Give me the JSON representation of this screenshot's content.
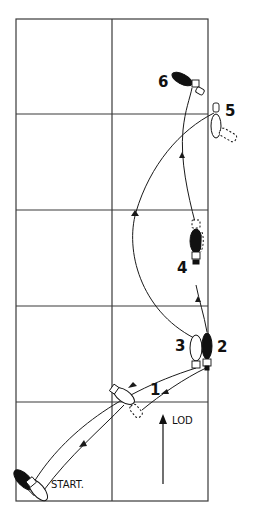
{
  "diagram": {
    "type": "dance-step-floor-pattern",
    "colors": {
      "line": "#1a1a1a",
      "grid": "#3a3a3a",
      "background": "#ffffff",
      "leader_foot": "#111111"
    },
    "grid": {
      "columns": 2,
      "rows": 5,
      "x": [
        16,
        112,
        208
      ],
      "y": [
        19,
        114,
        210,
        306,
        402,
        501
      ]
    },
    "labels": {
      "start": "START.",
      "lod": "LOD",
      "step_1": "1",
      "step_2": "2",
      "step_3": "3",
      "step_4": "4",
      "step_5": "5",
      "step_6": "6"
    },
    "heel_letters": {
      "left": "L",
      "right": "R"
    },
    "legend": {
      "black_foot": "leader foot (filled)",
      "white_foot": "foot (outline)"
    }
  }
}
